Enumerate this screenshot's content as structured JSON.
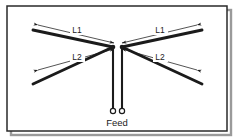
{
  "figure": {
    "background_color": "#ffffff",
    "line_color": "#1b1b1b",
    "border_color": "#2a2a2a",
    "shadow_color": "#9a9a9a",
    "labels": {
      "l1_left": "L1",
      "l1_right": "L1",
      "l2_left": "L2",
      "l2_right": "L2",
      "feed": "Feed"
    },
    "frame": {
      "x": 7,
      "y": 6,
      "width": 220,
      "height": 125
    },
    "center": {
      "left_node_x": 113,
      "right_node_x": 122,
      "node_y": 47
    },
    "elements": [
      {
        "name": "upper-left-radiator",
        "from_x": 113,
        "from_y": 47,
        "to_x": 33,
        "to_y": 30
      },
      {
        "name": "upper-right-radiator",
        "from_x": 122,
        "from_y": 47,
        "to_x": 202,
        "to_y": 30
      },
      {
        "name": "lower-left-radiator",
        "from_x": 113,
        "from_y": 47,
        "to_x": 33,
        "to_y": 84
      },
      {
        "name": "lower-right-radiator",
        "from_x": 122,
        "from_y": 47,
        "to_x": 202,
        "to_y": 84
      }
    ],
    "dimensions": [
      {
        "name": "l1-left-dimension",
        "label": "L1",
        "from_x": 38,
        "from_y": 25,
        "to_x": 114,
        "to_y": 43,
        "label_x": 77,
        "label_y": 31
      },
      {
        "name": "l1-right-dimension",
        "label": "L1",
        "from_x": 197,
        "from_y": 25,
        "to_x": 122,
        "to_y": 43,
        "label_x": 160,
        "label_y": 31
      },
      {
        "name": "l2-left-dimension",
        "label": "L2",
        "from_x": 38,
        "from_y": 70,
        "to_x": 114,
        "to_y": 49,
        "label_x": 77,
        "label_y": 58
      },
      {
        "name": "l2-right-dimension",
        "label": "L2",
        "from_x": 197,
        "from_y": 70,
        "to_x": 122,
        "to_y": 49,
        "label_x": 160,
        "label_y": 58
      }
    ],
    "feedline": {
      "left_wire_x": 113,
      "right_wire_x": 122,
      "top_y": 47,
      "bottom_y": 108,
      "terminal_radius": 2.6,
      "terminal_y": 111,
      "label_x": 117,
      "label_y": 124
    }
  }
}
